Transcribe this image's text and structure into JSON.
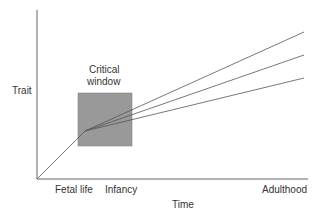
{
  "diagram": {
    "y_axis_label": "Trait",
    "x_axis_label": "Time",
    "x_ticks": [
      "Fetal life",
      "Infancy",
      "Adulthood"
    ],
    "box_label_line1": "Critical",
    "box_label_line2": "window",
    "colors": {
      "box_fill": "#999999",
      "line": "#555555",
      "axis": "#666666"
    },
    "trajectories": [
      "high",
      "middle",
      "low"
    ]
  }
}
